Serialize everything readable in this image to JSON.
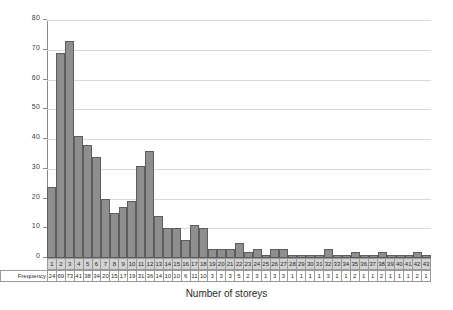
{
  "chart_data": {
    "type": "bar",
    "title": "",
    "xlabel": "Number of storeys",
    "ylabel": "",
    "ylim": [
      0,
      80
    ],
    "yticks": [
      0,
      10,
      20,
      30,
      40,
      50,
      60,
      70,
      80
    ],
    "grid": true,
    "legend": null,
    "bar_color": "#8e8e8e",
    "bar_border_color": "#5d5d5d",
    "gridline_color": "#d9d9d9",
    "axis_color": "#8a8a8a",
    "categories": [
      "1",
      "2",
      "3",
      "4",
      "5",
      "6",
      "7",
      "8",
      "9",
      "10",
      "11",
      "12",
      "13",
      "14",
      "15",
      "16",
      "17",
      "18",
      "19",
      "20",
      "21",
      "22",
      "23",
      "24",
      "25",
      "26",
      "27",
      "28",
      "29",
      "30",
      "31",
      "32",
      "33",
      "34",
      "35",
      "36",
      "37",
      "38",
      "39",
      "40",
      "41",
      "42",
      "43"
    ],
    "values": [
      24,
      69,
      73,
      41,
      38,
      34,
      20,
      15,
      17,
      19,
      31,
      36,
      14,
      10,
      10,
      6,
      11,
      10,
      3,
      3,
      3,
      5,
      2,
      3,
      1,
      3,
      3,
      1,
      1,
      1,
      1,
      3,
      1,
      1,
      2,
      1,
      1,
      2,
      1,
      1,
      1,
      2,
      1
    ]
  },
  "table": {
    "category_row_label": "",
    "frequency_row_label": "Frequency"
  },
  "axis": {
    "x_title": "Number of storeys"
  }
}
